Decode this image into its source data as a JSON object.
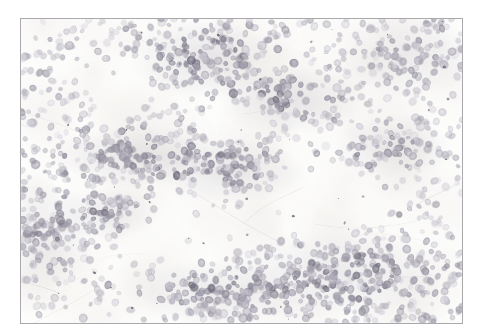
{
  "image": {
    "kind": "photomicrograph",
    "subject": "cytology-smear-lymphoid-cells",
    "stain": "hematoxylin-eosin",
    "frame": {
      "left": 20,
      "top": 18,
      "width": 443,
      "height": 306,
      "border_color": "#a9a9ad",
      "border_width": 1
    },
    "page_background": "#ffffff",
    "field_background": "#fbfbfa",
    "palette": {
      "background_white": "#fdfdfc",
      "background_warm": "#f6f4f1",
      "cell_pale": "#c9c6cd",
      "cell_mid": "#a8a4ae",
      "cell_dark": "#8b8794",
      "cell_deep": "#6f6b78",
      "cluster_haze": "#b4b1ba",
      "debris_dark": "#4a4750",
      "strand_gray": "#d6d4d6"
    },
    "cell_render": {
      "count": 1750,
      "radius_min": 2.6,
      "radius_max": 5.2,
      "opacity_min": 0.4,
      "opacity_max": 0.85
    },
    "clusters": [
      {
        "name": "upper-center-dense",
        "cx": 0.41,
        "cy": 0.13,
        "rx": 0.115,
        "ry": 0.085,
        "density": 1.0
      },
      {
        "name": "upper-right-band",
        "cx": 0.61,
        "cy": 0.27,
        "rx": 0.115,
        "ry": 0.075,
        "density": 0.95
      },
      {
        "name": "center-left-band",
        "cx": 0.26,
        "cy": 0.45,
        "rx": 0.135,
        "ry": 0.065,
        "density": 0.9
      },
      {
        "name": "center-core",
        "cx": 0.47,
        "cy": 0.5,
        "rx": 0.125,
        "ry": 0.07,
        "density": 1.0
      },
      {
        "name": "lower-left-nest",
        "cx": 0.19,
        "cy": 0.64,
        "rx": 0.085,
        "ry": 0.055,
        "density": 0.85
      },
      {
        "name": "right-mid-patch",
        "cx": 0.84,
        "cy": 0.42,
        "rx": 0.095,
        "ry": 0.07,
        "density": 0.8
      },
      {
        "name": "lower-right-field",
        "cx": 0.72,
        "cy": 0.84,
        "rx": 0.175,
        "ry": 0.1,
        "density": 0.85
      },
      {
        "name": "bottom-center-band",
        "cx": 0.44,
        "cy": 0.9,
        "rx": 0.15,
        "ry": 0.07,
        "density": 0.8
      },
      {
        "name": "left-edge-field",
        "cx": 0.05,
        "cy": 0.72,
        "rx": 0.08,
        "ry": 0.12,
        "density": 0.75
      },
      {
        "name": "top-right-field",
        "cx": 0.88,
        "cy": 0.12,
        "rx": 0.11,
        "ry": 0.09,
        "density": 0.8
      }
    ],
    "clear_zones": [
      {
        "name": "mid-right-clearing",
        "cx": 0.66,
        "cy": 0.6,
        "rx": 0.1,
        "ry": 0.075
      },
      {
        "name": "center-low-clearing",
        "cx": 0.4,
        "cy": 0.7,
        "rx": 0.09,
        "ry": 0.06
      },
      {
        "name": "upper-left-clearing",
        "cx": 0.22,
        "cy": 0.2,
        "rx": 0.085,
        "ry": 0.065
      },
      {
        "name": "upper-mid-clearing",
        "cx": 0.5,
        "cy": 0.33,
        "rx": 0.055,
        "ry": 0.045
      }
    ],
    "debris_specks": 42,
    "fiber_strands": 16
  }
}
